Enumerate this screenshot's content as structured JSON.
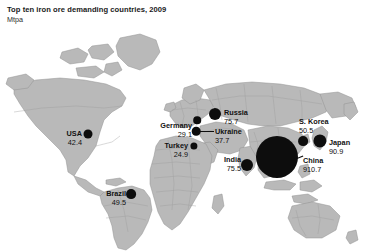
{
  "chart_data": {
    "type": "bubble-map",
    "title": "Top ten iron ore demanding countries, 2009",
    "subtitle": "Mtpa",
    "unit": "Mtpa",
    "xlabel": "",
    "ylabel": "",
    "legend": "none",
    "grid": false,
    "categories": [
      "China",
      "Japan",
      "Russia",
      "India",
      "S. Korea",
      "Brazil",
      "USA",
      "Ukraine",
      "Germany",
      "Turkey"
    ],
    "values": [
      910.7,
      90.9,
      75.7,
      75.5,
      50.5,
      49.5,
      42.4,
      37.7,
      29.1,
      24.9
    ],
    "points": [
      {
        "name": "China",
        "value": "910.7",
        "value_num": 910.7,
        "dot_x": 277,
        "dot_y": 157,
        "dot_r": 21,
        "label_x": 303,
        "label_y": 156,
        "label_side": "right",
        "leader": {
          "x": 292,
          "y": 160,
          "w": 12,
          "angle": -22
        }
      },
      {
        "name": "Japan",
        "value": "90.9",
        "value_num": 90.9,
        "dot_x": 320,
        "dot_y": 141,
        "dot_r": 6.6,
        "label_x": 329,
        "label_y": 138,
        "label_side": "right",
        "leader": null
      },
      {
        "name": "Russia",
        "value": "75.7",
        "value_num": 75.7,
        "dot_x": 215,
        "dot_y": 114,
        "dot_r": 6.0,
        "label_x": 224,
        "label_y": 108,
        "label_side": "right",
        "leader": null
      },
      {
        "name": "India",
        "value": "75.5",
        "value_num": 75.5,
        "dot_x": 247,
        "dot_y": 165,
        "dot_r": 6.0,
        "label_x": 241,
        "label_y": 155,
        "label_side": "left",
        "leader": null
      },
      {
        "name": "S. Korea",
        "value": "50.5",
        "value_num": 50.5,
        "dot_x": 303,
        "dot_y": 141,
        "dot_r": 4.9,
        "label_x": 299,
        "label_y": 117,
        "label_side": "right",
        "leader": null
      },
      {
        "name": "Brazil",
        "value": "49.5",
        "value_num": 49.5,
        "dot_x": 131,
        "dot_y": 194,
        "dot_r": 4.9,
        "label_x": 126,
        "label_y": 189,
        "label_side": "left",
        "leader": null
      },
      {
        "name": "USA",
        "value": "42.4",
        "value_num": 42.4,
        "dot_x": 88,
        "dot_y": 134,
        "dot_r": 4.5,
        "label_x": 82,
        "label_y": 129,
        "label_side": "left",
        "leader": null
      },
      {
        "name": "Ukraine",
        "value": "37.7",
        "value_num": 37.7,
        "dot_x": 196,
        "dot_y": 131,
        "dot_r": 4.3,
        "label_x": 215,
        "label_y": 127,
        "label_side": "right",
        "leader": {
          "x": 200,
          "y": 131,
          "w": 14,
          "angle": 0
        }
      },
      {
        "name": "Germany",
        "value": "29.1",
        "value_num": 29.1,
        "dot_x": 197,
        "dot_y": 120,
        "dot_r": 3.8,
        "label_x": 192,
        "label_y": 121,
        "label_side": "left",
        "leader": null
      },
      {
        "name": "Turkey",
        "value": "24.9",
        "value_num": 24.9,
        "dot_x": 194,
        "dot_y": 146,
        "dot_r": 3.6,
        "label_x": 188,
        "label_y": 141,
        "label_side": "left",
        "leader": null
      }
    ],
    "colors": {
      "bubble": "#0d0d0d",
      "land": "#b9b9b9",
      "land_border": "#8f8f8f",
      "ocean": "#ffffff",
      "text": "#111111"
    }
  }
}
